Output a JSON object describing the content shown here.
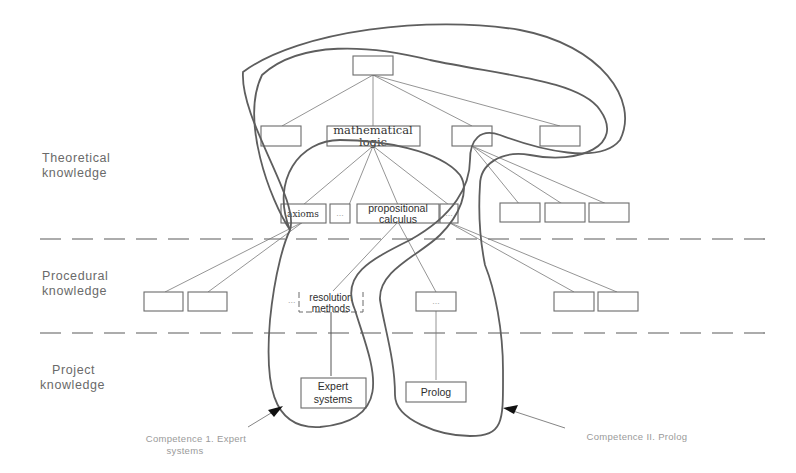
{
  "levels": [
    {
      "line1": "Theoretical",
      "line2": "knowledge"
    },
    {
      "line1": "Procedural",
      "line2": "knowledge"
    },
    {
      "line1": "Project",
      "line2": "knowledge"
    }
  ],
  "nodes": {
    "root": "",
    "math_logic_line1": "mathematical",
    "math_logic_line2": "logic",
    "axioms": "axioms",
    "ellipsis": "...",
    "prop_calc_line1": "propositional",
    "prop_calc_line2": "calculus",
    "resolution_line1": "resolution",
    "resolution_line2": "methods",
    "expert_line1": "Expert",
    "expert_line2": "systems",
    "prolog": "Prolog"
  },
  "competences": [
    {
      "line1": "Competence 1. Expert",
      "line2": "systems"
    },
    {
      "line1": "Competence II. Prolog",
      "line2": ""
    }
  ],
  "colors": {
    "stroke": "#5e5e5e",
    "label": "#6a6a6a",
    "caption": "#9a9a9a"
  }
}
